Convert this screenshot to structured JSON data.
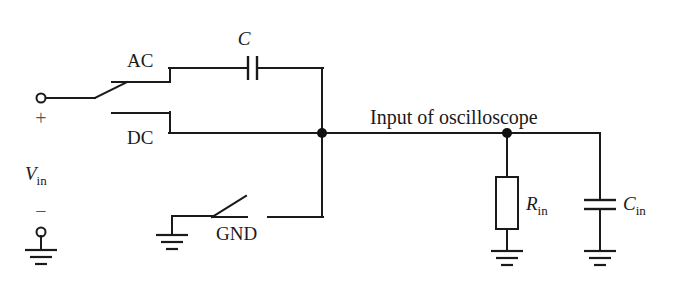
{
  "figure": {
    "kind": "circuit-schematic",
    "background_color": "#ffffff",
    "line_color": "#1a1a1a"
  },
  "labels": {
    "ac": "AC",
    "dc": "DC",
    "gnd": "GND",
    "coupling_capacitor": "C",
    "input_title": "Input of oscilloscope",
    "input_resistance_symbol": "R",
    "input_resistance_sub": "in",
    "input_capacitance_symbol": "C",
    "input_capacitance_sub": "in",
    "source_symbol": "V",
    "source_sub": "in",
    "plus_sign": "+",
    "minus_sign": "−"
  },
  "components": [
    {
      "id": "source-terminal-positive",
      "name": "positive input terminal",
      "type": "terminal",
      "label": "+"
    },
    {
      "id": "source-terminal-negative",
      "name": "negative input terminal",
      "type": "terminal",
      "label": "−"
    },
    {
      "id": "coupling-switch",
      "name": "coupling selector switch",
      "type": "spdt-switch",
      "positions": [
        "AC",
        "DC",
        "GND"
      ],
      "selected": "AC"
    },
    {
      "id": "coupling-capacitor",
      "name": "AC coupling capacitor",
      "type": "capacitor",
      "label": "C"
    },
    {
      "id": "gnd-switch",
      "name": "ground switch",
      "type": "switch",
      "label": "GND",
      "state": "open"
    },
    {
      "id": "input-resistor",
      "name": "oscilloscope input resistance",
      "type": "resistor",
      "label": "R_in"
    },
    {
      "id": "input-capacitor",
      "name": "oscilloscope input capacitance",
      "type": "capacitor",
      "label": "C_in"
    }
  ],
  "nodes": [
    {
      "id": "left-junction",
      "x": 322,
      "y": 133
    },
    {
      "id": "scope-input-junction",
      "x": 507,
      "y": 133
    }
  ]
}
